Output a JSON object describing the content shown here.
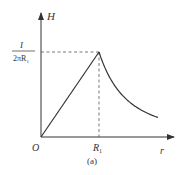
{
  "figure": {
    "caption": "(a)",
    "axes": {
      "y_label": "H",
      "x_label": "r",
      "origin_label": "O"
    },
    "ticks": {
      "x_tick_main": "R",
      "x_tick_sub": "1",
      "y_tick_numerator": "I",
      "y_tick_denominator_main": "2πR",
      "y_tick_denominator_sub": "1"
    },
    "curve": {
      "description": "H rises linearly from 0 at r=0 to I/(2πR1) at r=R1, then decays as 1/r for r>R1",
      "inside": "linear",
      "outside": "inverse"
    },
    "colors": {
      "line": "#333333",
      "dash": "#555555"
    }
  }
}
